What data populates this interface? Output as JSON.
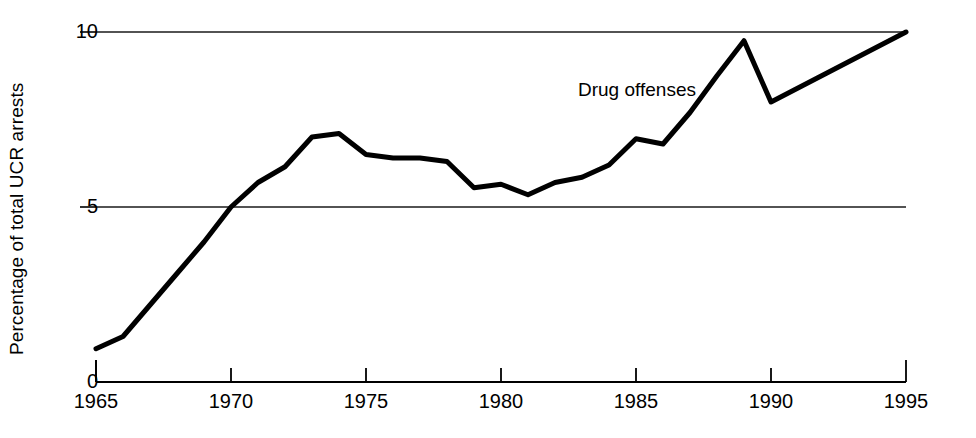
{
  "chart_data": {
    "type": "line",
    "title": "",
    "subtitle": "",
    "xlabel": "",
    "ylabel": "Percentage of total UCR arrests",
    "xlim": [
      1965,
      1995
    ],
    "ylim": [
      0,
      10
    ],
    "grid": true,
    "grid_lines_y": [
      5,
      10
    ],
    "legend_position": "inline-annotation",
    "x_ticks": [
      1965,
      1970,
      1975,
      1980,
      1985,
      1990,
      1995
    ],
    "x_tick_labels": [
      "1965",
      "1970",
      "1975",
      "1980",
      "1985",
      "1990",
      "1995"
    ],
    "y_ticks": [
      0,
      5,
      10
    ],
    "y_tick_labels": [
      "0",
      "5",
      "10"
    ],
    "annotations": [
      {
        "text": "Drug offenses",
        "x": 1982.8,
        "y": 8.55
      }
    ],
    "series": [
      {
        "name": "Drug offenses",
        "color": "#000000",
        "line_width": 5,
        "x": [
          1965,
          1966,
          1967,
          1968,
          1969,
          1970,
          1971,
          1972,
          1973,
          1974,
          1975,
          1976,
          1977,
          1978,
          1979,
          1980,
          1981,
          1982,
          1983,
          1984,
          1985,
          1986,
          1987,
          1988,
          1989,
          1990,
          1995
        ],
        "values": [
          0.95,
          1.3,
          2.2,
          3.1,
          4.0,
          5.0,
          5.7,
          6.15,
          7.0,
          7.1,
          6.5,
          6.4,
          6.4,
          6.3,
          5.55,
          5.65,
          5.35,
          5.7,
          5.85,
          6.2,
          6.95,
          6.8,
          7.7,
          8.75,
          9.75,
          8.0,
          10.0
        ]
      }
    ]
  },
  "axis": {
    "y_label": "Percentage of total UCR arrests",
    "y_tick_0": "0",
    "y_tick_5": "5",
    "y_tick_10": "10",
    "x_tick_1965": "1965",
    "x_tick_1970": "1970",
    "x_tick_1975": "1975",
    "x_tick_1980": "1980",
    "x_tick_1985": "1985",
    "x_tick_1990": "1990",
    "x_tick_1995": "1995"
  },
  "annotation": {
    "drug_offenses": "Drug offenses"
  },
  "colors": {
    "line": "#000000",
    "axis": "#000000",
    "grid": "#1a1a1a",
    "background": "#ffffff"
  }
}
